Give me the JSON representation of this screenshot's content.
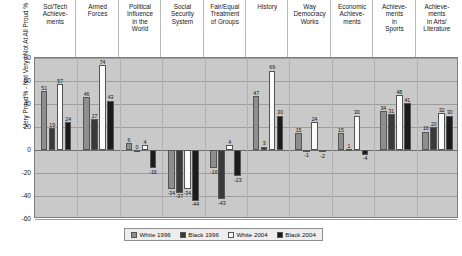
{
  "chart_data": {
    "type": "bar",
    "title": "",
    "xlabel": "",
    "ylabel": "Very Proud% - Not Very / Not At All Proud %",
    "ylim": [
      -60,
      80
    ],
    "yticks": [
      80,
      60,
      40,
      20,
      0,
      -20,
      -40,
      -60
    ],
    "grid": true,
    "legend_position": "bottom",
    "categories": [
      "Sci/Tech Achieve-ments",
      "Armed Forces",
      "Political Influence in the World",
      "Social Security System",
      "Fair/Equal Treatment of Groups",
      "History",
      "Way Democracy Works",
      "Economic Achieve-ments",
      "Achieve-ments in Sports",
      "Achieve-ments in Arts/ Literature"
    ],
    "category_lines": [
      [
        "Sci/Tech",
        "Achieve-",
        "ments"
      ],
      [
        "Armed",
        "Forces"
      ],
      [
        "Political",
        "Influence",
        "in the",
        "World"
      ],
      [
        "Social",
        "Security",
        "System"
      ],
      [
        "Fair/Equal",
        "Treatment",
        "of Groups"
      ],
      [
        "History"
      ],
      [
        "Way",
        "Democracy",
        "Works"
      ],
      [
        "Economic",
        "Achieve-",
        "ments"
      ],
      [
        "Achieve-",
        "ments",
        "in",
        "Sports"
      ],
      [
        "Achieve-",
        "ments",
        "in Arts/",
        "Literature"
      ]
    ],
    "series": [
      {
        "name": "White 1996",
        "color": "#8e8e8e",
        "values": [
          51,
          46,
          6,
          -34,
          -16,
          47,
          15,
          15,
          34,
          16
        ]
      },
      {
        "name": "Black 1996",
        "color": "#3a3a3a",
        "values": [
          19,
          27,
          0,
          -37,
          -43,
          3,
          -1,
          1,
          31,
          20
        ]
      },
      {
        "name": "White 2004",
        "color": "#fbfbfb",
        "values": [
          57,
          74,
          4,
          -34,
          4,
          69,
          24,
          30,
          48,
          32
        ]
      },
      {
        "name": "Black 2004",
        "color": "#1b1b1b",
        "values": [
          24,
          43,
          -16,
          -44,
          -23,
          30,
          -2,
          -4,
          41,
          30
        ]
      }
    ]
  },
  "legend": {
    "items": [
      {
        "label": "White 1996",
        "swatch": "w96"
      },
      {
        "label": "Black 1996",
        "swatch": "b96"
      },
      {
        "label": "White 2004",
        "swatch": "w04"
      },
      {
        "label": "Black 2004",
        "swatch": "b04"
      }
    ]
  }
}
